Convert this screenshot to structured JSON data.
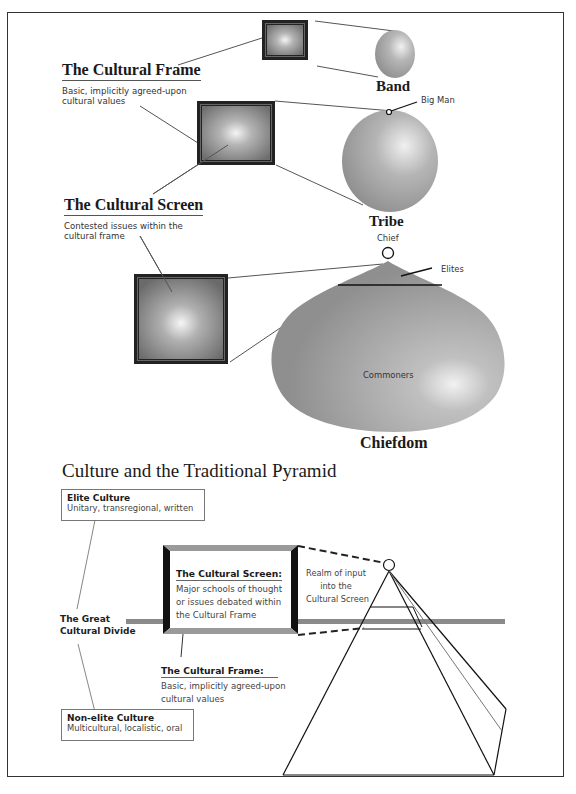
{
  "top_diagram": {
    "labels": {
      "cultural_frame": {
        "title": "The Cultural Frame",
        "description_line1": "Basic, implicitly agreed-upon",
        "description_line2": "cultural values"
      },
      "cultural_screen": {
        "title": "The Cultural Screen",
        "description_line1": "Contested issues within the",
        "description_line2": "cultural frame"
      }
    },
    "societies": [
      {
        "name": "Band"
      },
      {
        "name": "Tribe",
        "leader_label": "Big Man"
      },
      {
        "name": "Chiefdom",
        "leader_label": "Chief",
        "upper_label": "Elites",
        "lower_label": "Commoners"
      }
    ]
  },
  "bottom_diagram": {
    "title": "Culture and the Traditional Pyramid",
    "elite_culture": {
      "title": "Elite Culture",
      "description": "Unitary, transregional, written"
    },
    "great_divide": {
      "line1": "The Great",
      "line2": "Cultural Divide"
    },
    "non_elite_culture": {
      "title": "Non-elite Culture",
      "description": "Multicultural, localistic, oral"
    },
    "cultural_screen": {
      "title": "The Cultural Screen:",
      "line1": "Major schools of thought",
      "line2": "or issues debated within",
      "line3": "the Cultural Frame"
    },
    "cultural_frame": {
      "title": "The Cultural Frame:",
      "line1": "Basic, implicitly agreed-upon",
      "line2": "cultural values"
    },
    "realm_of_input": {
      "line1": "Realm of input",
      "line2": "into the",
      "line3": "Cultural Screen"
    }
  },
  "colors": {
    "outline": "#333333",
    "divide_bar": "#8a8a8a",
    "sphere_mid": "#a8a8a8",
    "sphere_light": "#f2f2f2",
    "frame_dark": "#222222"
  }
}
